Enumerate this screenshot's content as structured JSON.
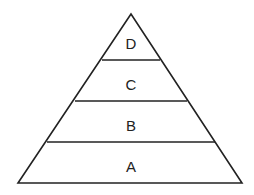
{
  "diagram": {
    "type": "pyramid",
    "stroke_color": "#222222",
    "background_color": "#ffffff",
    "tiers": [
      {
        "label": "D",
        "position": "top"
      },
      {
        "label": "C",
        "position": "upper-middle"
      },
      {
        "label": "B",
        "position": "lower-middle"
      },
      {
        "label": "A",
        "position": "bottom"
      }
    ]
  }
}
